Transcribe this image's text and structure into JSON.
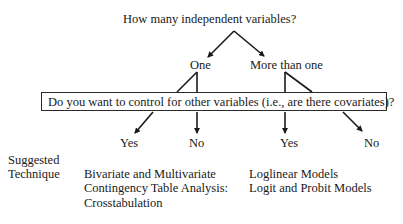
{
  "diagram": {
    "root_question": "How many independent variables?",
    "level1": {
      "left": "One",
      "right": "More than one"
    },
    "covariate_question": "Do you want to control for other variables (i.e., are there covariates)?",
    "level2": {
      "one_yes": "Yes",
      "one_no": "No",
      "more_yes": "Yes",
      "more_no": "No"
    },
    "suggested_label": {
      "line1": "Suggested",
      "line2": "Technique"
    },
    "techniques": {
      "one": [
        "Bivariate and Multivariate",
        "Contingency Table Analysis:",
        "Crosstabulation"
      ],
      "more": [
        "Loglinear Models",
        "Logit and Probit Models"
      ]
    },
    "colors": {
      "line": "#1a1a1a",
      "text": "#1a1a1a",
      "background": "#ffffff"
    }
  }
}
